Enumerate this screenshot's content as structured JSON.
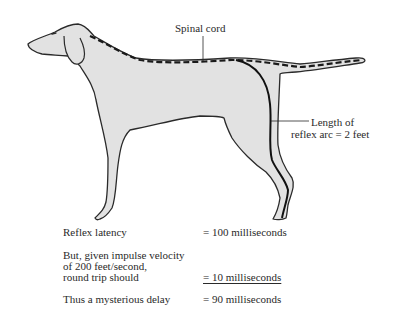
{
  "diagram": {
    "colors": {
      "body_fill": "#e2e2e2",
      "outline": "#2a2a2a",
      "spinal_cord": "#1a1a1a",
      "nerve_path": "#111111",
      "background": "#ffffff"
    },
    "labels": {
      "spinal_cord": "Spinal cord",
      "reflex_arc_line1": "Length of",
      "reflex_arc_line2": "reflex arc = 2 feet"
    }
  },
  "calculation": {
    "rows": [
      {
        "label_lines": [
          "Reflex latency"
        ],
        "value": "= 100 milliseconds",
        "underlined": false
      },
      {
        "label_lines": [
          "But, given impulse velocity",
          "of 200 feet/second,",
          "round trip should"
        ],
        "value": "= 10 milliseconds",
        "underlined": true
      },
      {
        "label_lines": [
          "Thus a mysterious delay"
        ],
        "value": "= 90 milliseconds",
        "underlined": false
      }
    ]
  }
}
